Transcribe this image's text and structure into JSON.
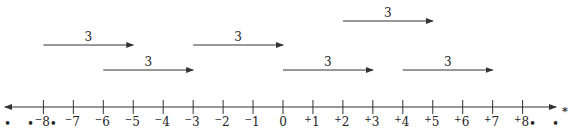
{
  "diagram": {
    "axis": {
      "min": -8,
      "max": 8,
      "ticks": [
        {
          "value": -8,
          "sign": "−",
          "num": "8"
        },
        {
          "value": -7,
          "sign": "−",
          "num": "7"
        },
        {
          "value": -6,
          "sign": "−",
          "num": "6"
        },
        {
          "value": -5,
          "sign": "−",
          "num": "5"
        },
        {
          "value": -4,
          "sign": "−",
          "num": "4"
        },
        {
          "value": -3,
          "sign": "−",
          "num": "3"
        },
        {
          "value": -2,
          "sign": "−",
          "num": "2"
        },
        {
          "value": -1,
          "sign": "−",
          "num": "1"
        },
        {
          "value": 0,
          "sign": "",
          "num": "0"
        },
        {
          "value": 1,
          "sign": "+",
          "num": "1"
        },
        {
          "value": 2,
          "sign": "+",
          "num": "2"
        },
        {
          "value": 3,
          "sign": "+",
          "num": "3"
        },
        {
          "value": 4,
          "sign": "+",
          "num": "4"
        },
        {
          "value": 5,
          "sign": "+",
          "num": "5"
        },
        {
          "value": 6,
          "sign": "+",
          "num": "6"
        },
        {
          "value": 7,
          "sign": "+",
          "num": "7"
        },
        {
          "value": 8,
          "sign": "+",
          "num": "8"
        }
      ],
      "left_ellipsis": "• • •",
      "right_ellipsis": "• • •",
      "right_marker": "*"
    },
    "jumps": [
      {
        "from": 2,
        "to": 5,
        "label": "3",
        "row": 0
      },
      {
        "from": -8,
        "to": -5,
        "label": "3",
        "row": 1
      },
      {
        "from": -3,
        "to": 0,
        "label": "3",
        "row": 1
      },
      {
        "from": -6,
        "to": -3,
        "label": "3",
        "row": 2
      },
      {
        "from": 0,
        "to": 3,
        "label": "3",
        "row": 2
      },
      {
        "from": 4,
        "to": 7,
        "label": "3",
        "row": 2
      }
    ]
  },
  "colors": {
    "line": "#333333",
    "text": "#222222",
    "background": "#ffffff"
  }
}
